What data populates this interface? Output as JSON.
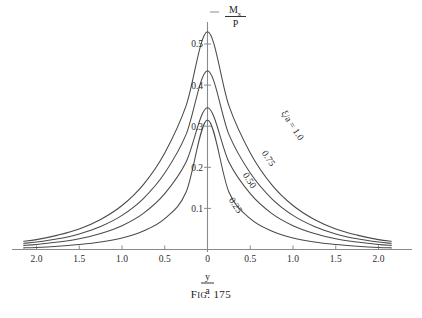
{
  "figure": {
    "caption_prefix": "F",
    "caption_smallcaps": "IG",
    "caption_dot": ".",
    "caption_number": "175",
    "caption_full": "Fig. 175"
  },
  "axes": {
    "y_axis_label": {
      "numerator": "M",
      "numerator_sub": "x",
      "denominator": "P",
      "full": "Mx/P"
    },
    "x_axis_label": {
      "numerator": "y",
      "denominator": "a",
      "full": "y/a"
    },
    "x_ticks": [
      "2.0",
      "1.5",
      "1.0",
      "0.5",
      "0",
      "0.5",
      "1.0",
      "1.5",
      "2.0"
    ],
    "x_tick_values": [
      -2.0,
      -1.5,
      -1.0,
      -0.5,
      0,
      0.5,
      1.0,
      1.5,
      2.0
    ],
    "y_ticks": [
      "0.1",
      "0.2",
      "0.3",
      "0.4",
      "0.5"
    ],
    "y_tick_values": [
      0.1,
      0.2,
      0.3,
      0.4,
      0.5
    ],
    "xlim": [
      -2.15,
      2.15
    ],
    "ylim": [
      0,
      0.56
    ],
    "grid": false
  },
  "chart_data": {
    "type": "line",
    "xlabel": "y/a",
    "ylabel": "Mx/P",
    "xlim": [
      -2.15,
      2.15
    ],
    "ylim": [
      0,
      0.56
    ],
    "grid": false,
    "legend_position": "inline-on-curves",
    "x": [
      -2.15,
      -2.0,
      -1.75,
      -1.5,
      -1.25,
      -1.0,
      -0.75,
      -0.5,
      -0.25,
      0,
      0.25,
      0.5,
      0.75,
      1.0,
      1.25,
      1.5,
      1.75,
      2.0,
      2.15
    ],
    "series": [
      {
        "name": "xi/a = 1.0",
        "label": "ξ/a = 1.0",
        "peak": 0.53,
        "values": [
          0.02,
          0.024,
          0.035,
          0.05,
          0.073,
          0.107,
          0.158,
          0.235,
          0.35,
          0.53,
          0.35,
          0.235,
          0.158,
          0.107,
          0.073,
          0.05,
          0.035,
          0.024,
          0.02
        ]
      },
      {
        "name": "0.75",
        "label": "0.75",
        "peak": 0.435,
        "values": [
          0.015,
          0.018,
          0.026,
          0.038,
          0.056,
          0.083,
          0.124,
          0.186,
          0.28,
          0.435,
          0.28,
          0.186,
          0.124,
          0.083,
          0.056,
          0.038,
          0.026,
          0.018,
          0.015
        ]
      },
      {
        "name": "0.50",
        "label": "0.50",
        "peak": 0.345,
        "values": [
          0.01,
          0.012,
          0.018,
          0.026,
          0.039,
          0.058,
          0.088,
          0.136,
          0.213,
          0.345,
          0.213,
          0.136,
          0.088,
          0.058,
          0.039,
          0.026,
          0.018,
          0.012,
          0.01
        ]
      },
      {
        "name": "0.25",
        "label": "0.25",
        "peak": 0.315,
        "values": [
          0.004,
          0.005,
          0.008,
          0.012,
          0.018,
          0.028,
          0.045,
          0.075,
          0.14,
          0.315,
          0.14,
          0.075,
          0.045,
          0.028,
          0.018,
          0.012,
          0.008,
          0.005,
          0.004
        ]
      }
    ],
    "curve_labels": [
      {
        "text": "ξ/a = 1.0",
        "x": 290,
        "y": 127,
        "rotation": 57
      },
      {
        "text": "0.75",
        "x": 266,
        "y": 160,
        "rotation": 57
      },
      {
        "text": "0.50",
        "x": 247,
        "y": 182,
        "rotation": 57
      },
      {
        "text": "0.25",
        "x": 233,
        "y": 207,
        "rotation": 57
      }
    ]
  },
  "colors": {
    "background": "#ffffff",
    "curve": "#4a4a4a",
    "axis": "#8a8a8a",
    "text": "#1d1d1d"
  }
}
